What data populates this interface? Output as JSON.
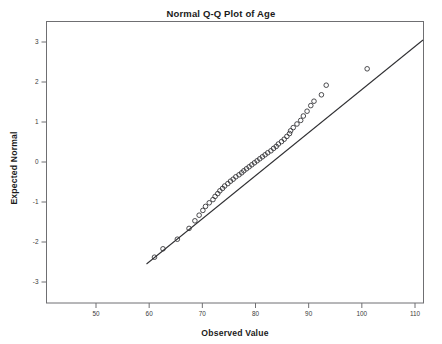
{
  "chart_data": {
    "type": "scatter",
    "title": "Normal Q-Q Plot of Age",
    "xlabel": "Observed Value",
    "ylabel": "Expected Normal",
    "xlim": [
      46,
      115
    ],
    "ylim": [
      -3.4,
      3.4
    ],
    "xticks": [
      50,
      60,
      70,
      80,
      90,
      100,
      110
    ],
    "yticks": [
      3,
      2,
      1,
      0,
      -1,
      -2,
      -3
    ],
    "grid": false,
    "legend": null,
    "marker": "open-circle",
    "reference_line": {
      "label": "normal reference line",
      "x_start": 59.5,
      "y_start": -2.55,
      "x_end": 111.5,
      "y_end": 3.05
    },
    "series": [
      {
        "name": "Age",
        "points": [
          [
            61.0,
            -2.38
          ],
          [
            62.6,
            -2.17
          ],
          [
            65.3,
            -1.93
          ],
          [
            67.5,
            -1.66
          ],
          [
            68.6,
            -1.47
          ],
          [
            69.4,
            -1.33
          ],
          [
            70.1,
            -1.21
          ],
          [
            70.6,
            -1.11
          ],
          [
            71.3,
            -1.02
          ],
          [
            72.0,
            -0.94
          ],
          [
            72.4,
            -0.86
          ],
          [
            72.9,
            -0.79
          ],
          [
            73.3,
            -0.72
          ],
          [
            73.8,
            -0.66
          ],
          [
            74.2,
            -0.6
          ],
          [
            74.8,
            -0.54
          ],
          [
            75.3,
            -0.48
          ],
          [
            75.8,
            -0.43
          ],
          [
            76.3,
            -0.37
          ],
          [
            76.9,
            -0.32
          ],
          [
            77.4,
            -0.27
          ],
          [
            77.8,
            -0.22
          ],
          [
            78.3,
            -0.17
          ],
          [
            78.8,
            -0.12
          ],
          [
            79.3,
            -0.07
          ],
          [
            79.8,
            -0.02
          ],
          [
            80.3,
            0.03
          ],
          [
            80.8,
            0.08
          ],
          [
            81.3,
            0.13
          ],
          [
            81.8,
            0.18
          ],
          [
            82.3,
            0.23
          ],
          [
            82.9,
            0.28
          ],
          [
            83.4,
            0.34
          ],
          [
            83.9,
            0.39
          ],
          [
            84.3,
            0.45
          ],
          [
            84.9,
            0.51
          ],
          [
            85.4,
            0.57
          ],
          [
            85.9,
            0.64
          ],
          [
            86.4,
            0.71
          ],
          [
            86.6,
            0.78
          ],
          [
            87.1,
            0.86
          ],
          [
            87.8,
            0.95
          ],
          [
            88.5,
            1.04
          ],
          [
            89.0,
            1.15
          ],
          [
            89.7,
            1.27
          ],
          [
            90.4,
            1.41
          ],
          [
            91.0,
            1.52
          ],
          [
            92.4,
            1.68
          ],
          [
            93.3,
            1.92
          ],
          [
            101.0,
            2.33
          ]
        ]
      }
    ]
  }
}
